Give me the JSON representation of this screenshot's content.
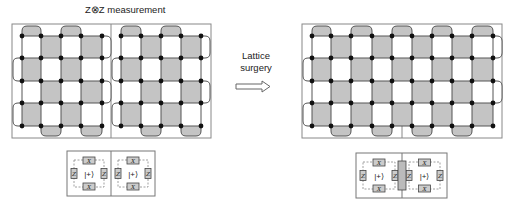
{
  "title": "Z⊗Z measurement",
  "arrow_label": {
    "line1": "Lattice",
    "line2": "surgery"
  },
  "colors": {
    "stabilizer_fill": "#c4c4c4",
    "line": "#555555",
    "qubit": "#111111",
    "frame": "#888888"
  },
  "left_figure": {
    "columns": [
      22,
      41,
      61,
      81,
      102,
      121,
      141,
      161,
      181,
      201
    ],
    "rows": [
      36,
      58,
      81,
      103,
      126
    ],
    "frame": [
      12,
      24,
      211,
      138
    ],
    "divider_x": 111
  },
  "right_figure": {
    "columns": [
      312,
      331,
      351,
      372,
      392,
      412,
      432,
      452,
      472,
      493
    ],
    "rows": [
      36,
      58,
      81,
      103,
      126
    ],
    "frame": [
      302,
      24,
      502,
      138
    ],
    "seam_x": 402
  },
  "bottom_left": {
    "ket": "|+⟩",
    "op_x": "X",
    "op_z": "Z"
  },
  "bottom_right": {
    "ket": "|+⟩",
    "op_x": "X",
    "op_z": "Z"
  }
}
